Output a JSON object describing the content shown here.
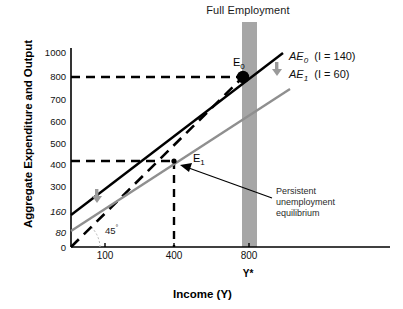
{
  "chart_data": {
    "type": "line",
    "title": "Full Employment",
    "xlabel": "Income (Y)",
    "ylabel": "Aggregate Expenditure and Output",
    "xlim": [
      0,
      950
    ],
    "ylim": [
      0,
      1050
    ],
    "grid": false,
    "legend_position": "top-right",
    "xticks": [
      {
        "value": 100,
        "label": "100"
      },
      {
        "value": 400,
        "label": "400"
      },
      {
        "value": 800,
        "label": "800"
      }
    ],
    "yticks": [
      {
        "value": 1000,
        "label": "1000",
        "italic": false
      },
      {
        "value": 800,
        "label": "800",
        "italic": false
      },
      {
        "value": 700,
        "label": "700",
        "italic": false
      },
      {
        "value": 600,
        "label": "600",
        "italic": false
      },
      {
        "value": 500,
        "label": "500",
        "italic": false
      },
      {
        "value": 400,
        "label": "400",
        "italic": false
      },
      {
        "value": 300,
        "label": "300",
        "italic": false
      },
      {
        "value": 160,
        "label": "160",
        "italic": true
      },
      {
        "value": 80,
        "label": "80",
        "italic": true
      },
      {
        "value": 0,
        "label": "0",
        "italic": false
      }
    ],
    "series": [
      {
        "name": "AE_0",
        "label": "AE",
        "subscript": "0",
        "note": "(I = 140)",
        "color": "#000000",
        "style": "solid",
        "intercept": 160,
        "slope": 0.775,
        "x": [
          50,
          880
        ],
        "y": [
          199,
          842
        ]
      },
      {
        "name": "AE_1",
        "label": "AE",
        "subscript": "1",
        "note": "(I = 60)",
        "color": "#8f8f8f",
        "style": "solid",
        "intercept": 80,
        "slope": 0.775,
        "x": [
          50,
          900
        ],
        "y": [
          119,
          778
        ]
      },
      {
        "name": "45-degree-line",
        "label": "45",
        "note": "45° reference line",
        "color": "#000000",
        "style": "dashed",
        "intercept": 0,
        "slope": 1.0,
        "x": [
          0,
          880
        ],
        "y": [
          0,
          880
        ]
      }
    ],
    "points": [
      {
        "name": "E0",
        "label": "E",
        "subscript": "0",
        "x": 800,
        "y": 780,
        "marker": "filled-circle"
      },
      {
        "name": "E1",
        "label": "E",
        "subscript": "1",
        "x": 400,
        "y": 390,
        "marker": "small-dot"
      }
    ],
    "guides": [
      {
        "type": "hline",
        "y": 780,
        "style": "dashed"
      },
      {
        "type": "hline",
        "y": 390,
        "style": "dashed"
      },
      {
        "type": "vline",
        "x": 400,
        "style": "dashed"
      }
    ],
    "bands": [
      {
        "name": "full-employment-band",
        "x": 800,
        "width": 45,
        "color": "#a6a6a6"
      }
    ],
    "annotations": [
      {
        "name": "persistent-unemployment",
        "text": "Persistent\nunemployment\nequilibrium",
        "target_point": "E1"
      },
      {
        "name": "shift-arrow-right",
        "text": "",
        "icon": "down-arrow"
      },
      {
        "name": "shift-arrow-left",
        "text": "",
        "icon": "down-arrow"
      }
    ]
  },
  "legend": {
    "items": [
      {
        "name": "AE",
        "sub": "0",
        "note": "(I = 140)"
      },
      {
        "name": "AE",
        "sub": "1",
        "note": "(I = 60)"
      }
    ]
  },
  "labels": {
    "title": "Full Employment",
    "ylabel": "Aggregate Expenditure and Output",
    "xlabel": "Income (Y)",
    "ystar": "Y*",
    "degree": "45",
    "e0": "E",
    "e0_sub": "0",
    "e1": "E",
    "e1_sub": "1",
    "annotation_line1": "Persistent",
    "annotation_line2": "unemployment",
    "annotation_line3": "equilibrium"
  },
  "colors": {
    "ae0": "#000000",
    "ae1": "#8f8f8f",
    "band": "#a6a6a6",
    "axis": "#000000",
    "arrow": "#9a9a9a"
  }
}
